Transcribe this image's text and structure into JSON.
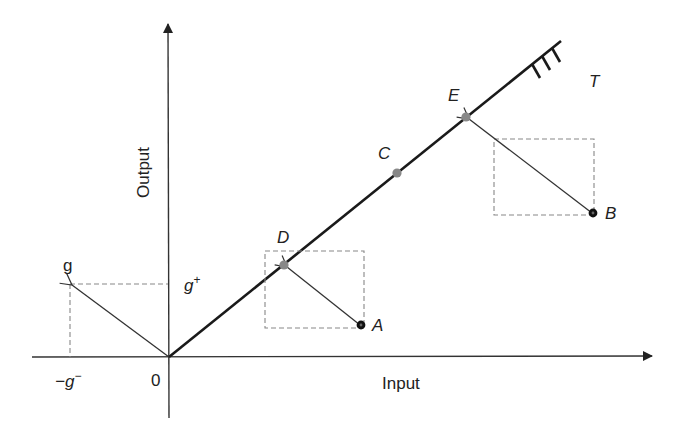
{
  "diagram": {
    "axes": {
      "x_label": "Input",
      "y_label": "Output",
      "origin_label": "0"
    },
    "constraint_line_label": "T",
    "vector_labels": {
      "g": "g",
      "g_plus": "g",
      "g_plus_sup": "+",
      "g_minus_prefix": "−g",
      "g_minus_sup": "−"
    },
    "points": [
      {
        "id": "A",
        "label": "A",
        "type": "external",
        "color": "#111111"
      },
      {
        "id": "B",
        "label": "B",
        "type": "external",
        "color": "#111111"
      },
      {
        "id": "C",
        "label": "C",
        "type": "on-line",
        "color": "#888888"
      },
      {
        "id": "D",
        "label": "D",
        "type": "on-line",
        "color": "#888888"
      },
      {
        "id": "E",
        "label": "E",
        "type": "on-line",
        "color": "#888888"
      }
    ],
    "projections": [
      {
        "from": "A",
        "to": "D"
      },
      {
        "from": "B",
        "to": "E"
      }
    ],
    "colors": {
      "axis": "#333333",
      "line": "#1a1a1a",
      "dashed": "#888888",
      "point_on_line": "#888888",
      "point_external": "#111111"
    }
  }
}
